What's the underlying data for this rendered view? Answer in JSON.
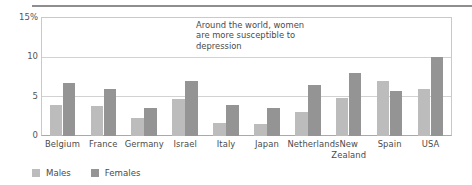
{
  "chart_data": {
    "type": "bar",
    "title": "",
    "subtitle": "",
    "xlabel": "",
    "ylabel": "",
    "ylim": [
      0,
      15
    ],
    "yticks": [
      "15%",
      "10",
      "5",
      "0"
    ],
    "ytick_values": [
      15,
      10,
      5,
      0
    ],
    "grid": true,
    "grid_axis": "y",
    "legend_position": "bottom-left",
    "categories": [
      "Belgium",
      "France",
      "Germany",
      "Israel",
      "Italy",
      "Japan",
      "Netherlands",
      "New Zealand",
      "Spain",
      "USA"
    ],
    "series": [
      {
        "name": "Males",
        "color": "#bcbcbc",
        "values": [
          4.0,
          3.8,
          2.3,
          4.7,
          1.6,
          1.5,
          3.0,
          4.8,
          7.0,
          6.0
        ]
      },
      {
        "name": "Females",
        "color": "#949494",
        "values": [
          6.8,
          6.0,
          3.5,
          7.0,
          4.0,
          3.5,
          6.5,
          8.0,
          5.7,
          10.0
        ]
      }
    ],
    "annotations": [
      {
        "text": "Around the world, women are more susceptible to depression"
      }
    ]
  },
  "annotation": {
    "line1": "Around the world, women",
    "line2": "are more susceptible to",
    "line3": "depression"
  },
  "legend": {
    "items": [
      {
        "label": "Males"
      },
      {
        "label": "Females"
      }
    ]
  },
  "axis": {
    "y_top_label": "15%",
    "y_mid_label": "10",
    "y_low_label": "5",
    "y_zero_label": "0"
  }
}
